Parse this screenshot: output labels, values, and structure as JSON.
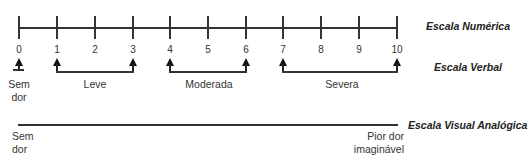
{
  "numeric_scale": {
    "title": "Escala Numérica",
    "ticks": [
      "0",
      "1",
      "2",
      "3",
      "4",
      "5",
      "6",
      "7",
      "8",
      "9",
      "10"
    ]
  },
  "verbal_scale": {
    "title": "Escala Verbal",
    "no_pain": {
      "line1": "Sem",
      "line2": "dor"
    },
    "ranges": [
      {
        "label": "Leve",
        "from": "1",
        "to": "3"
      },
      {
        "label": "Moderada",
        "from": "4",
        "to": "6"
      },
      {
        "label": "Severa",
        "from": "7",
        "to": "10"
      }
    ]
  },
  "visual_analog_scale": {
    "title": "Escala Visual Analógica",
    "left": {
      "line1": "Sem",
      "line2": "dor"
    },
    "right": {
      "line1": "Pior dor",
      "line2": "imaginável"
    }
  }
}
